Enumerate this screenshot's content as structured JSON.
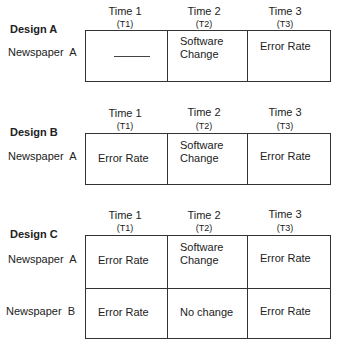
{
  "time_headers": [
    {
      "label": "Time 1",
      "code": "(T1)"
    },
    {
      "label": "Time 2",
      "code": "(T2)"
    },
    {
      "label": "Time 3",
      "code": "(T3)"
    }
  ],
  "designs": [
    {
      "title": "Design A",
      "rows": [
        {
          "label": "Newspaper  A",
          "cells": [
            "———",
            "Software Change",
            "Error Rate"
          ]
        }
      ]
    },
    {
      "title": "Design B",
      "rows": [
        {
          "label": "Newspaper  A",
          "cells": [
            "Error Rate",
            "Software Change",
            "Error Rate"
          ]
        }
      ]
    },
    {
      "title": "Design C",
      "rows": [
        {
          "label": "Newspaper  A",
          "cells": [
            "Error Rate",
            "Software Change",
            "Error Rate"
          ]
        },
        {
          "label": "Newspaper  B",
          "cells": [
            "Error Rate",
            "No change",
            "Error Rate"
          ]
        }
      ]
    }
  ]
}
